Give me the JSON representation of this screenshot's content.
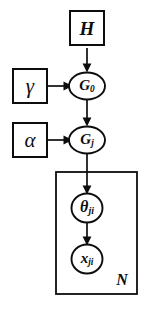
{
  "figure": {
    "background_color": "#ffffff",
    "stroke_color": "#0d0d0d",
    "width": 145,
    "height": 310
  },
  "nodes": {
    "h": {
      "label": "H",
      "shape": "square",
      "kind": "hyperparameter",
      "cx": 87,
      "cy": 29
    },
    "gamma": {
      "label": "γ",
      "shape": "square",
      "kind": "hyperparameter",
      "cx": 30,
      "cy": 86
    },
    "g0": {
      "label": "G",
      "subscript": "0",
      "shape": "ellipse",
      "kind": "latent-variable",
      "cx": 87,
      "cy": 86
    },
    "alpha": {
      "label": "α",
      "shape": "square",
      "kind": "hyperparameter",
      "cx": 30,
      "cy": 140
    },
    "gj": {
      "label": "G",
      "subscript": "j",
      "shape": "ellipse",
      "kind": "latent-variable",
      "cx": 87,
      "cy": 140
    },
    "theta": {
      "label": "θ",
      "subscript": "ji",
      "shape": "circle",
      "kind": "latent-variable",
      "cx": 87,
      "cy": 208
    },
    "x": {
      "label": "x",
      "subscript": "ji",
      "shape": "circle",
      "kind": "observed-variable",
      "cx": 87,
      "cy": 259
    }
  },
  "plate": {
    "label": "N",
    "x": 56,
    "y": 172,
    "width": 81,
    "height": 122
  },
  "edges": [
    {
      "from": "h",
      "to": "g0",
      "direction": "down"
    },
    {
      "from": "gamma",
      "to": "g0",
      "direction": "right"
    },
    {
      "from": "g0",
      "to": "gj",
      "direction": "down"
    },
    {
      "from": "alpha",
      "to": "gj",
      "direction": "right"
    },
    {
      "from": "gj",
      "to": "theta",
      "direction": "down"
    },
    {
      "from": "theta",
      "to": "x",
      "direction": "down"
    }
  ]
}
